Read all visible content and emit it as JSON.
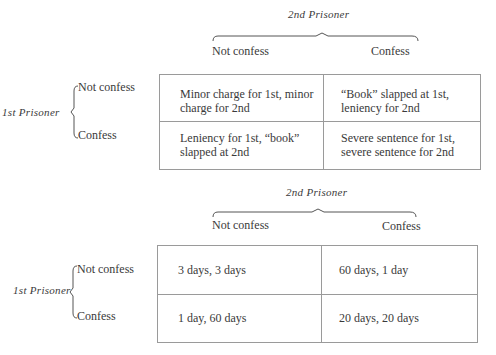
{
  "matrices": [
    {
      "column_player": "2nd Prisoner",
      "row_player": "1st Prisoner",
      "column_options": [
        "Not confess",
        "Confess"
      ],
      "row_options": [
        "Not confess",
        "Confess"
      ],
      "cells": [
        [
          "Minor charge for 1st, minor charge for 2nd",
          "“Book” slapped at 1st, leniency for 2nd"
        ],
        [
          "Leniency for 1st, “book” slapped at 2nd",
          "Severe sentence for 1st, severe sentence for 2nd"
        ]
      ],
      "cell_lines": [
        [
          [
            "Minor charge for 1st, minor",
            "charge for 2nd"
          ],
          [
            "“Book” slapped at 1st,",
            "leniency for 2nd"
          ]
        ],
        [
          [
            "Leniency for 1st, “book”",
            "slapped at 2nd"
          ],
          [
            "Severe sentence for 1st,",
            "severe sentence for 2nd"
          ]
        ]
      ]
    },
    {
      "column_player": "2nd Prisoner",
      "row_player": "1st Prisoner",
      "column_options": [
        "Not confess",
        "Confess"
      ],
      "row_options": [
        "Not confess",
        "Confess"
      ],
      "cells": [
        [
          "3 days, 3 days",
          "60 days, 1 day"
        ],
        [
          "1 day, 60 days",
          "20 days, 20 days"
        ]
      ]
    }
  ]
}
